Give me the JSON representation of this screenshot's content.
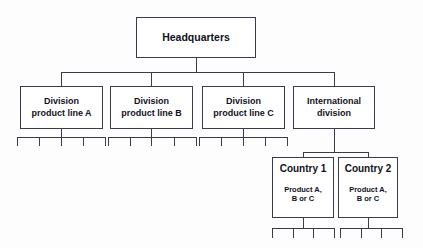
{
  "diagram": {
    "type": "org-chart",
    "title_text": "Headquarters",
    "background_color": "#fdfdfd",
    "line_color": "#3a3a4a",
    "box_fill": "#ffffff",
    "text_color": "#111122"
  },
  "root": {
    "label": "Headquarters"
  },
  "divisions": [
    {
      "line1": "Division",
      "line2": "product line A",
      "leaf_count": 5
    },
    {
      "line1": "Division",
      "line2": "product line B",
      "leaf_count": 5
    },
    {
      "line1": "Division",
      "line2": "product line C",
      "leaf_count": 5
    },
    {
      "line1": "International",
      "line2": "division",
      "leaf_count": 0
    }
  ],
  "countries": [
    {
      "title": "Country 1",
      "sub_line1": "Product A,",
      "sub_line2": "B or C",
      "leaf_count": 4
    },
    {
      "title": "Country 2",
      "sub_line1": "Product A,",
      "sub_line2": "B or C",
      "leaf_count": 4
    }
  ]
}
